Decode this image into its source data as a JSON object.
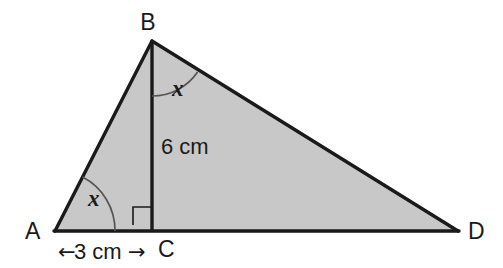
{
  "figure": {
    "type": "geometry-diagram",
    "shape": "triangle",
    "background_color": "#ffffff",
    "fill_color": "#c8c8c8",
    "stroke_color": "#1a1a1a",
    "vertices": {
      "A": {
        "label": "A",
        "x": 55,
        "y": 231
      },
      "B": {
        "label": "B",
        "x": 152,
        "y": 41
      },
      "C": {
        "label": "C",
        "x": 152,
        "y": 231
      },
      "D": {
        "label": "D",
        "x": 458,
        "y": 231
      }
    },
    "labels": {
      "a": "A",
      "b": "B",
      "c": "C",
      "d": "D"
    },
    "measurements": {
      "height_bc": "6 cm",
      "base_ac": "3 cm",
      "left_arrow": "←",
      "right_arrow": "→"
    },
    "angles": {
      "at_a": "x",
      "at_b": "x",
      "right_angle_at_c": "90°"
    }
  }
}
